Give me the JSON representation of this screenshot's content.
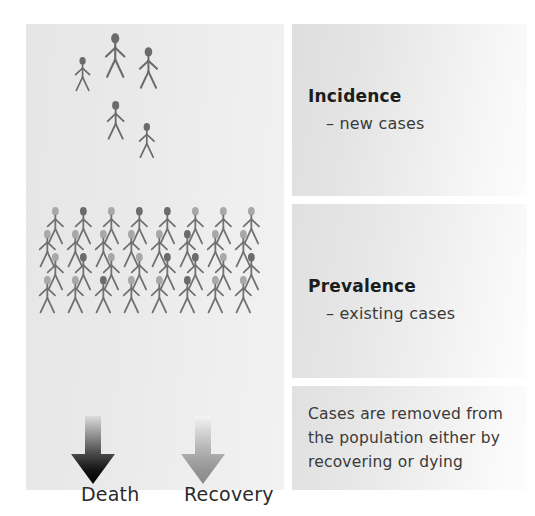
{
  "diagram": {
    "title_semantic": "incidence-prevalence-diagram",
    "panels": {
      "incidence": {
        "heading": "Incidence",
        "subtext": "– new cases",
        "figure_count": 5,
        "figure_color": "#6b6b6b"
      },
      "prevalence": {
        "heading": "Prevalence",
        "subtext": "– existing cases",
        "figure_count": 32,
        "rows": 4,
        "per_row": 8,
        "light_head_color": "#a8a8a8",
        "dark_head_color": "#6b6b6b",
        "body_color": "#707070"
      },
      "removal": {
        "lines": [
          "Cases are removed from",
          "the population either by",
          "recovering or dying"
        ]
      }
    },
    "outcomes": [
      {
        "label": "Death",
        "icon": "down-arrow-icon",
        "gradient_from": "#d8d8d8",
        "gradient_to": "#000000"
      },
      {
        "label": "Recovery",
        "icon": "down-arrow-icon",
        "gradient_from": "#f2f2f2",
        "gradient_to": "#8c8c8c"
      }
    ],
    "colors": {
      "panel_light": "#e6e6e6",
      "panel_white": "#fcfcfc",
      "text": "#2b2b2b",
      "background": "#ffffff"
    }
  }
}
